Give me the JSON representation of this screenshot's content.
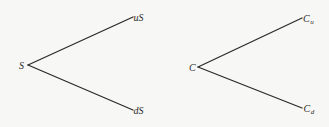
{
  "diagram": {
    "type": "binomial-tree",
    "colors": {
      "background": "#f7f7f5",
      "line": "#2b2b2b",
      "text": "#2b2b2b"
    },
    "trees": [
      {
        "name": "stock-price-tree",
        "root": {
          "label": "S"
        },
        "up": {
          "label": "uS"
        },
        "down": {
          "label": "dS"
        }
      },
      {
        "name": "option-price-tree",
        "root": {
          "label": "C"
        },
        "up": {
          "label": "C",
          "subscript": "u"
        },
        "down": {
          "label": "C",
          "subscript": "d"
        }
      }
    ]
  }
}
